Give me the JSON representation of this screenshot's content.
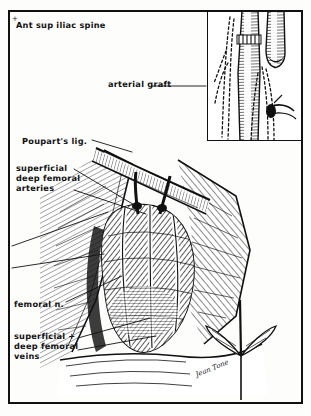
{
  "plate": {
    "kind": "surgical-anatomical-illustration",
    "technique": "pen-and-ink cross-hatch engraving",
    "ink_color": "#111111",
    "paper_color": "#fdfdfb",
    "frame_color": "#111111"
  },
  "labels": {
    "iliac_spine": "Ant sup iliac spine",
    "arterial_graft": "arterial graft",
    "poupart_ligament": "Poupart's lig.",
    "femoral_arteries": "superficial\ndeep femoral\narteries",
    "femoral_nerve": "femoral n.",
    "femoral_veins": "superficial +\ndeep femoral\nveins"
  },
  "marks": {
    "iliac_spine_tick": "+"
  },
  "signature": {
    "artist": "Jean Tone"
  },
  "inset": {
    "name": "arterial-graft-detail",
    "contents": "anastomosed vessel graft with dashed suture/outline tracings"
  },
  "regions": {
    "main_field": "femoral triangle dissection with exposed vascular mass",
    "retractor": "self-retaining wound retractor, lower right"
  }
}
